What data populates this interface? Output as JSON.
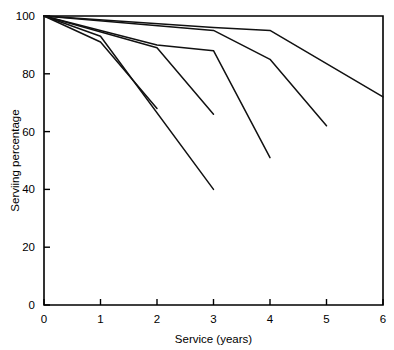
{
  "chart_data": {
    "type": "line",
    "title": "",
    "subtitle": "",
    "xlabel": "Service (years)",
    "ylabel": "Serviing percentage",
    "xlim": [
      0,
      6
    ],
    "ylim": [
      0,
      100
    ],
    "xticks": [
      0,
      1,
      2,
      3,
      4,
      5,
      6
    ],
    "xtick_labels": [
      "0",
      "1",
      "2",
      "3",
      "4",
      "5",
      "6"
    ],
    "yticks": [
      0,
      20,
      40,
      60,
      80,
      100
    ],
    "ytick_labels": [
      "0",
      "20",
      "40",
      "60",
      "80",
      "100"
    ],
    "grid": false,
    "legend": false,
    "legend_position": "none",
    "annotations": [],
    "series": [
      {
        "name": "curve-1",
        "x": [
          0,
          3,
          4,
          6
        ],
        "values": [
          100,
          96,
          95,
          72
        ]
      },
      {
        "name": "curve-2",
        "x": [
          0,
          3,
          4,
          5
        ],
        "values": [
          100,
          95,
          85,
          62
        ]
      },
      {
        "name": "curve-3",
        "x": [
          0,
          2,
          3,
          4
        ],
        "values": [
          100,
          90,
          88,
          51
        ]
      },
      {
        "name": "curve-4",
        "x": [
          0,
          2,
          3
        ],
        "values": [
          100,
          89,
          66
        ]
      },
      {
        "name": "curve-5",
        "x": [
          0,
          1,
          3
        ],
        "values": [
          100,
          93,
          40
        ]
      },
      {
        "name": "curve-6",
        "x": [
          0,
          1,
          2
        ],
        "values": [
          100,
          91,
          68
        ]
      }
    ]
  }
}
